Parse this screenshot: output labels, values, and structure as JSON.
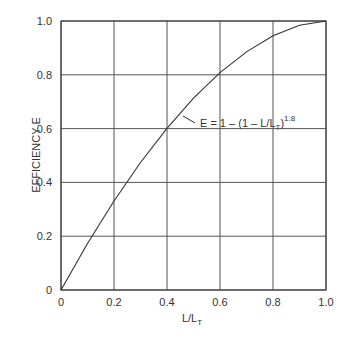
{
  "chart_data": {
    "type": "line",
    "title": "",
    "xlabel": "L/L_T",
    "ylabel": "EFFICIENCY E",
    "xlim": [
      0,
      1.0
    ],
    "ylim": [
      0,
      1.0
    ],
    "grid": true,
    "x_ticks": [
      "0",
      "0.2",
      "0.4",
      "0.6",
      "0.8",
      "1.0"
    ],
    "y_ticks": [
      "0",
      "0.2",
      "0.4",
      "0.6",
      "0.8",
      "1.0"
    ],
    "series": [
      {
        "name": "E = 1 - (1 - L/L_T)^1.8",
        "x": [
          0,
          0.1,
          0.2,
          0.3,
          0.4,
          0.5,
          0.6,
          0.7,
          0.8,
          0.9,
          1.0
        ],
        "y": [
          0,
          0.173,
          0.331,
          0.474,
          0.601,
          0.713,
          0.808,
          0.885,
          0.945,
          0.984,
          1.0
        ]
      }
    ],
    "annotations": [
      {
        "text_main": "E = 1 – (1 – L/L",
        "subscript": "T",
        "close": ")",
        "superscript": "1.8",
        "arrow_to": [
          0.47,
          0.68
        ]
      }
    ]
  },
  "axes": {
    "xlabel_main": "L/L",
    "xlabel_sub": "T",
    "ylabel": "EFFICIENCY E"
  }
}
